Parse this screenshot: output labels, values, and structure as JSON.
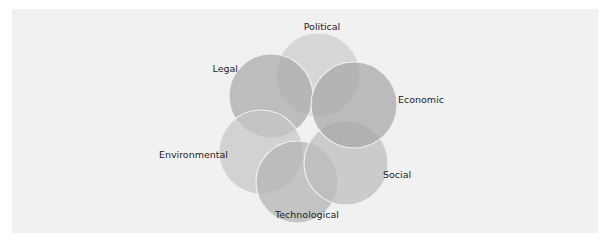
{
  "diagram": {
    "title": "",
    "type": "overlapping-circles",
    "segments": [
      {
        "id": "political",
        "label": "Political",
        "shade": "#cdcdcd"
      },
      {
        "id": "economic",
        "label": "Economic",
        "shade": "#a6a6a6"
      },
      {
        "id": "social",
        "label": "Social",
        "shade": "#bdbdbd"
      },
      {
        "id": "technological",
        "label": "Technological",
        "shade": "#b3b3b3"
      },
      {
        "id": "environmental",
        "label": "Environmental",
        "shade": "#c6c6c6"
      },
      {
        "id": "legal",
        "label": "Legal",
        "shade": "#a9a9a9"
      }
    ],
    "stroke_color": "#efefef",
    "text_color": "#1e1e1e",
    "panel_color": "#f1f1f1"
  }
}
